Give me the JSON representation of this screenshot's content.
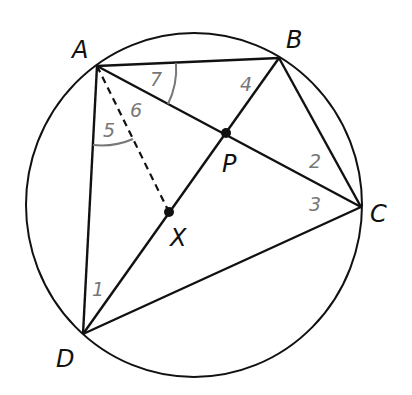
{
  "diagram": {
    "circle": {
      "cx": 194,
      "cy": 205,
      "rx": 168,
      "ry": 172
    },
    "points": {
      "A": {
        "x": 97,
        "y": 66,
        "label": "A"
      },
      "B": {
        "x": 279,
        "y": 58,
        "label": "B"
      },
      "C": {
        "x": 361,
        "y": 207,
        "label": "C"
      },
      "D": {
        "x": 83,
        "y": 334,
        "label": "D"
      },
      "P": {
        "x": 226,
        "y": 133,
        "label": "P"
      },
      "X": {
        "x": 169,
        "y": 212,
        "label": "X"
      }
    },
    "segments": [
      "AB",
      "BC",
      "CD",
      "DA",
      "AC",
      "BD",
      "BC"
    ],
    "dashed_segments": [
      "AX"
    ],
    "angle_labels": {
      "a1": "1",
      "a2": "2",
      "a3": "3",
      "a4": "4",
      "a5": "5",
      "a6": "6",
      "a7": "7"
    },
    "colors": {
      "line": "#111111",
      "angle_label": "#777777",
      "arc": "#777777"
    }
  }
}
